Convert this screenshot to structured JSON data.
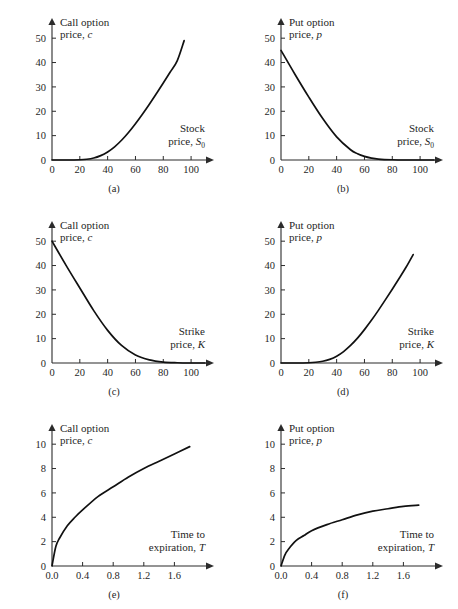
{
  "figure": {
    "title": "",
    "background_color": "#ffffff",
    "curve_color": "#111111",
    "axis_color": "#2b2b2b"
  },
  "panels": [
    {
      "id": "a",
      "caption": "(a)",
      "ylabel_line1": "Call option",
      "ylabel_line2_prefix": "price, ",
      "ylabel_line2_symbol": "c",
      "xlabel_line1": "Stock",
      "xlabel_line2_prefix": "price, ",
      "xlabel_line2_symbol": "S",
      "xlabel_line2_subscript": "0",
      "xticks": [
        "0",
        "20",
        "40",
        "60",
        "80",
        "100"
      ],
      "yticks": [
        "0",
        "10",
        "20",
        "30",
        "40",
        "50"
      ]
    },
    {
      "id": "b",
      "caption": "(b)",
      "ylabel_line1": "Put option",
      "ylabel_line2_prefix": "price, ",
      "ylabel_line2_symbol": "p",
      "xlabel_line1": "Stock",
      "xlabel_line2_prefix": "price, ",
      "xlabel_line2_symbol": "S",
      "xlabel_line2_subscript": "0",
      "xticks": [
        "0",
        "20",
        "40",
        "60",
        "80",
        "100"
      ],
      "yticks": [
        "0",
        "10",
        "20",
        "30",
        "40",
        "50"
      ]
    },
    {
      "id": "c",
      "caption": "(c)",
      "ylabel_line1": "Call option",
      "ylabel_line2_prefix": "price, ",
      "ylabel_line2_symbol": "c",
      "xlabel_line1": "Strike",
      "xlabel_line2_prefix": "price, ",
      "xlabel_line2_symbol": "K",
      "xlabel_line2_subscript": "",
      "xticks": [
        "0",
        "20",
        "40",
        "60",
        "80",
        "100"
      ],
      "yticks": [
        "0",
        "10",
        "20",
        "30",
        "40",
        "50"
      ]
    },
    {
      "id": "d",
      "caption": "(d)",
      "ylabel_line1": "Put option",
      "ylabel_line2_prefix": "price, ",
      "ylabel_line2_symbol": "p",
      "xlabel_line1": "Strike",
      "xlabel_line2_prefix": "price, ",
      "xlabel_line2_symbol": "K",
      "xlabel_line2_subscript": "",
      "xticks": [
        "0",
        "20",
        "40",
        "60",
        "80",
        "100"
      ],
      "yticks": [
        "0",
        "10",
        "20",
        "30",
        "40",
        "50"
      ]
    },
    {
      "id": "e",
      "caption": "(e)",
      "ylabel_line1": "Call option",
      "ylabel_line2_prefix": "price, ",
      "ylabel_line2_symbol": "c",
      "xlabel_line1": "Time to",
      "xlabel_line2_prefix": "expiration, ",
      "xlabel_line2_symbol": "T",
      "xlabel_line2_subscript": "",
      "xticks": [
        "0.0",
        "0.4",
        "0.8",
        "1.2",
        "1.6"
      ],
      "yticks": [
        "0",
        "2",
        "4",
        "6",
        "8",
        "10"
      ]
    },
    {
      "id": "f",
      "caption": "(f)",
      "ylabel_line1": "Put option",
      "ylabel_line2_prefix": "price, ",
      "ylabel_line2_symbol": "p",
      "xlabel_line1": "Time to",
      "xlabel_line2_prefix": "expiration, ",
      "xlabel_line2_symbol": "T",
      "xlabel_line2_subscript": "",
      "xticks": [
        "0.0",
        "0.4",
        "0.8",
        "1.2",
        "1.6"
      ],
      "yticks": [
        "0",
        "2",
        "4",
        "6",
        "8",
        "10"
      ]
    }
  ],
  "chart_data": [
    {
      "type": "line",
      "panel": "a",
      "title": "(a)",
      "xlabel": "Stock price, S0",
      "ylabel": "Call option price, c",
      "xlim": [
        0,
        110
      ],
      "ylim": [
        0,
        55
      ],
      "xticks": [
        0,
        20,
        40,
        60,
        80,
        100
      ],
      "yticks": [
        0,
        10,
        20,
        30,
        40,
        50
      ],
      "grid": false,
      "legend": "none",
      "x": [
        0,
        10,
        20,
        25,
        30,
        35,
        40,
        45,
        50,
        55,
        60,
        65,
        70,
        75,
        80,
        85,
        90,
        95
      ],
      "y": [
        0.0,
        0.0,
        0.1,
        0.3,
        0.8,
        1.8,
        3.3,
        5.4,
        8.1,
        11.3,
        14.9,
        18.8,
        22.9,
        27.2,
        31.6,
        36.1,
        40.7,
        49.0
      ]
    },
    {
      "type": "line",
      "panel": "b",
      "title": "(b)",
      "xlabel": "Stock price, S0",
      "ylabel": "Put option price, p",
      "xlim": [
        0,
        110
      ],
      "ylim": [
        0,
        55
      ],
      "xticks": [
        0,
        20,
        40,
        60,
        80,
        100
      ],
      "yticks": [
        0,
        10,
        20,
        30,
        40,
        50
      ],
      "grid": false,
      "legend": "none",
      "x": [
        0,
        10,
        20,
        30,
        40,
        50,
        55,
        60,
        65,
        70,
        80,
        90,
        100,
        110
      ],
      "y": [
        45.0,
        35.2,
        25.8,
        17.0,
        9.5,
        4.2,
        2.6,
        1.5,
        0.8,
        0.4,
        0.1,
        0.0,
        0.0,
        0.0
      ]
    },
    {
      "type": "line",
      "panel": "c",
      "title": "(c)",
      "xlabel": "Strike price, K",
      "ylabel": "Call option price, c",
      "xlim": [
        0,
        110
      ],
      "ylim": [
        0,
        55
      ],
      "xticks": [
        0,
        20,
        40,
        60,
        80,
        100
      ],
      "yticks": [
        0,
        10,
        20,
        30,
        40,
        50
      ],
      "grid": false,
      "legend": "none",
      "x": [
        0,
        10,
        20,
        30,
        40,
        50,
        60,
        70,
        80,
        90,
        100,
        110
      ],
      "y": [
        50.0,
        40.2,
        30.8,
        21.5,
        13.4,
        7.2,
        3.3,
        1.3,
        0.4,
        0.1,
        0.0,
        0.0
      ]
    },
    {
      "type": "line",
      "panel": "d",
      "title": "(d)",
      "xlabel": "Strike price, K",
      "ylabel": "Put option price, p",
      "xlim": [
        0,
        110
      ],
      "ylim": [
        0,
        55
      ],
      "xticks": [
        0,
        20,
        40,
        60,
        80,
        100
      ],
      "yticks": [
        0,
        10,
        20,
        30,
        40,
        50
      ],
      "grid": false,
      "legend": "none",
      "x": [
        0,
        10,
        20,
        25,
        30,
        35,
        40,
        45,
        50,
        55,
        60,
        65,
        70,
        75,
        80,
        85,
        90,
        95
      ],
      "y": [
        0.0,
        0.0,
        0.1,
        0.3,
        0.7,
        1.5,
        2.8,
        4.7,
        7.2,
        10.2,
        13.7,
        17.5,
        21.6,
        25.9,
        30.3,
        34.8,
        39.4,
        44.5
      ]
    },
    {
      "type": "line",
      "panel": "e",
      "title": "(e)",
      "xlabel": "Time to expiration, T",
      "ylabel": "Call option price, c",
      "xlim": [
        0.0,
        2.0
      ],
      "ylim": [
        0,
        11
      ],
      "xticks": [
        0.0,
        0.4,
        0.8,
        1.2,
        1.6
      ],
      "yticks": [
        0,
        2,
        4,
        6,
        8,
        10
      ],
      "grid": false,
      "legend": "none",
      "x": [
        0.0,
        0.05,
        0.1,
        0.2,
        0.3,
        0.4,
        0.6,
        0.8,
        1.0,
        1.2,
        1.4,
        1.6,
        1.8
      ],
      "y": [
        0.0,
        1.6,
        2.3,
        3.3,
        4.0,
        4.6,
        5.7,
        6.5,
        7.3,
        8.0,
        8.6,
        9.2,
        9.8
      ]
    },
    {
      "type": "line",
      "panel": "f",
      "title": "(f)",
      "xlabel": "Time to expiration, T",
      "ylabel": "Put option price, p",
      "xlim": [
        0.0,
        2.0
      ],
      "ylim": [
        0,
        11
      ],
      "xticks": [
        0.0,
        0.4,
        0.8,
        1.2,
        1.6
      ],
      "yticks": [
        0,
        2,
        4,
        6,
        8,
        10
      ],
      "grid": false,
      "legend": "none",
      "x": [
        0.0,
        0.05,
        0.1,
        0.2,
        0.3,
        0.4,
        0.6,
        0.8,
        1.0,
        1.2,
        1.4,
        1.6,
        1.8
      ],
      "y": [
        0.0,
        0.9,
        1.4,
        2.1,
        2.5,
        2.9,
        3.4,
        3.8,
        4.2,
        4.5,
        4.7,
        4.9,
        5.0
      ]
    }
  ]
}
